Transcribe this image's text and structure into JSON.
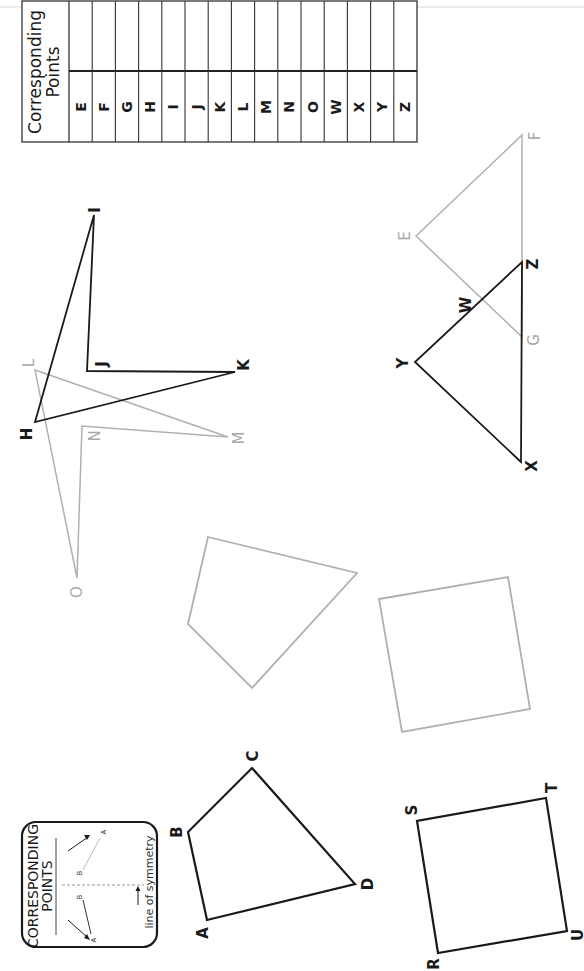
{
  "table": {
    "header": "Corresponding\nPoints",
    "header_line1": "Corresponding",
    "header_line2": "Points",
    "columns": [
      "E",
      "F",
      "G",
      "H",
      "I",
      "J",
      "K",
      "L",
      "M",
      "N",
      "O",
      "W",
      "X",
      "Y",
      "Z"
    ],
    "answers": [
      "",
      "",
      "",
      "",
      "",
      "",
      "",
      "",
      "",
      "",
      "",
      "",
      "",
      "",
      ""
    ]
  },
  "legend": {
    "title_line1": "CORRESPONDING",
    "title_line2": "POINTS",
    "point_a": "A",
    "point_b": "B",
    "caption": "line of symmetry"
  },
  "colors": {
    "original_shape": "#1a1a1a",
    "image_shape": "#a8a8a8"
  },
  "figures": {
    "quad_abcd": {
      "style": "dark",
      "points": {
        "A": [
          207,
          920
        ],
        "B": [
          188,
          832
        ],
        "C": [
          252,
          768
        ],
        "D": [
          355,
          884
        ]
      },
      "labels": {
        "A": "A",
        "B": "B",
        "C": "C",
        "D": "D"
      }
    },
    "quad_rstu": {
      "style": "dark",
      "points": {
        "R": [
          438,
          953
        ],
        "S": [
          417,
          821
        ],
        "T": [
          546,
          798
        ],
        "U": [
          567,
          931
        ]
      },
      "labels": {
        "R": "R",
        "S": "S",
        "T": "T",
        "U": "U"
      }
    },
    "quad_gray_1": {
      "style": "gray",
      "points": [
        [
          208,
          537
        ],
        [
          357,
          573
        ],
        [
          252,
          688
        ],
        [
          188,
          624
        ]
      ]
    },
    "quad_gray_2": {
      "style": "gray",
      "points": [
        [
          379,
          599
        ],
        [
          508,
          577
        ],
        [
          530,
          709
        ],
        [
          402,
          732
        ]
      ]
    },
    "hijk": {
      "style": "dark",
      "points": {
        "H": [
          35,
          422
        ],
        "I": [
          94,
          215
        ],
        "J": [
          87,
          371
        ],
        "K": [
          235,
          372
        ]
      },
      "labels": {
        "H": "H",
        "I": "I",
        "J": "J",
        "K": "K"
      }
    },
    "lmno": {
      "style": "gray",
      "points": {
        "L": [
          35,
          370
        ],
        "M": [
          228,
          437
        ],
        "N": [
          82,
          426
        ],
        "O": [
          77,
          578
        ]
      },
      "labels": {
        "L": "L",
        "M": "M",
        "N": "N",
        "O": "O"
      }
    },
    "triangle_xyz": {
      "style": "dark",
      "points": {
        "X": [
          521,
          462
        ],
        "Y": [
          415,
          362
        ],
        "Z": [
          522,
          262
        ]
      },
      "labels": {
        "X": "X",
        "Y": "Y",
        "Z": "Z",
        "W": "W"
      }
    },
    "triangle_efg": {
      "style": "gray",
      "points": {
        "E": [
          416,
          236
        ],
        "F": [
          522,
          135
        ],
        "G": [
          522,
          337
        ]
      },
      "labels": {
        "E": "E",
        "F": "F",
        "G": "G"
      }
    }
  }
}
